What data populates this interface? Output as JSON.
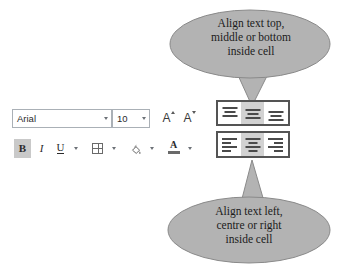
{
  "callouts": {
    "top": {
      "name": "vertical-alignment-callout",
      "lines": [
        "Align text top,",
        "middle or bottom",
        "inside cell"
      ],
      "fill": "#b3b3b3",
      "stroke": "#8a8a8a"
    },
    "bottom": {
      "name": "horizontal-alignment-callout",
      "lines": [
        "Align text left,",
        "centre or right",
        "inside cell"
      ],
      "fill": "#b3b3b3",
      "stroke": "#8a8a8a"
    }
  },
  "toolbar": {
    "font_name": {
      "value": "Arial",
      "dropdown_icon": "chevron-down-icon"
    },
    "font_size": {
      "value": "10",
      "dropdown_icon": "chevron-down-icon"
    },
    "increase_font_size": {
      "label": "A",
      "icon": "increase-font-size-icon"
    },
    "decrease_font_size": {
      "label": "A",
      "icon": "decrease-font-size-icon"
    },
    "bold": {
      "label": "B",
      "active": true
    },
    "italic": {
      "label": "I",
      "active": false
    },
    "underline": {
      "label": "U",
      "active": false
    },
    "borders": {
      "icon": "borders-icon"
    },
    "fill_color": {
      "icon": "fill-color-icon"
    },
    "font_color": {
      "label": "A",
      "icon": "font-color-icon"
    },
    "vertical_align": {
      "group_label": "Vertical alignment",
      "buttons": [
        {
          "name": "align-top-button",
          "label": "Top Align",
          "selected": false
        },
        {
          "name": "align-middle-button",
          "label": "Middle Align",
          "selected": true
        },
        {
          "name": "align-bottom-button",
          "label": "Bottom Align",
          "selected": false
        }
      ]
    },
    "horizontal_align": {
      "group_label": "Horizontal alignment",
      "buttons": [
        {
          "name": "align-left-button",
          "label": "Align Left",
          "selected": false
        },
        {
          "name": "align-center-button",
          "label": "Center",
          "selected": true
        },
        {
          "name": "align-right-button",
          "label": "Align Right",
          "selected": false
        }
      ]
    }
  },
  "colors": {
    "callout_fill": "#b3b3b3",
    "callout_stroke": "#8a8a8a",
    "group_outline": "#545454",
    "selected_button": "#d2d2d2",
    "field_border": "#aab0b6"
  }
}
